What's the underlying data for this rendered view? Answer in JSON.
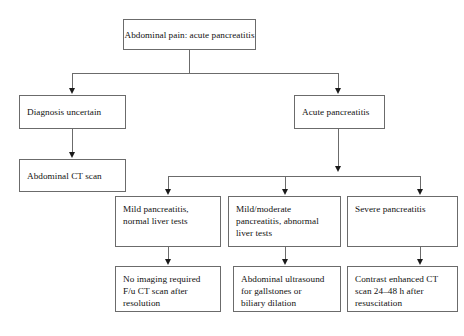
{
  "diagram": {
    "type": "flowchart",
    "colors": {
      "background": "#ffffff",
      "box_border": "#6b6b6b",
      "connector": "#6b6b6b",
      "arrowhead": "#1a1a1a",
      "text": "#111111"
    },
    "nodes": {
      "root": "Abdominal pain: acute pancreatitis",
      "diagnosis_uncertain": "Diagnosis uncertain",
      "abdominal_ct_scan": "Abdominal CT scan",
      "acute_pancreatitis": "Acute pancreatitis",
      "mild_normal": "Mild pancreatitis,\nnormal liver tests",
      "mild_moderate_abnormal": "Mild/moderate\npancreatitis, abnormal\nliver tests",
      "severe": "Severe pancreatitis",
      "no_imaging": "No imaging required\nF/u CT scan after\nresolution",
      "abdominal_ultrasound": "Abdominal ultrasound\nfor gallstones or\nbiliary dilation",
      "contrast_ct": "Contrast enhanced CT\nscan 24–48 h after\nresuscitation"
    },
    "edges": [
      {
        "from": "root",
        "to": "diagnosis_uncertain"
      },
      {
        "from": "root",
        "to": "acute_pancreatitis"
      },
      {
        "from": "diagnosis_uncertain",
        "to": "abdominal_ct_scan"
      },
      {
        "from": "acute_pancreatitis",
        "to": "mild_normal"
      },
      {
        "from": "acute_pancreatitis",
        "to": "mild_moderate_abnormal"
      },
      {
        "from": "acute_pancreatitis",
        "to": "severe"
      },
      {
        "from": "mild_normal",
        "to": "no_imaging"
      },
      {
        "from": "mild_moderate_abnormal",
        "to": "abdominal_ultrasound"
      },
      {
        "from": "severe",
        "to": "contrast_ct"
      }
    ]
  }
}
